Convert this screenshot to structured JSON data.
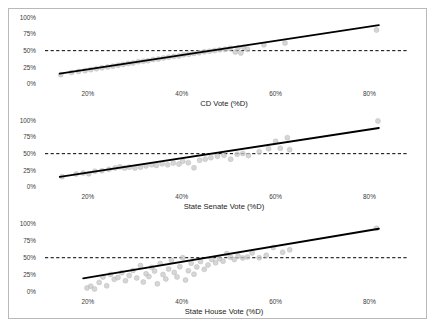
{
  "figure": {
    "background_color": "#ffffff",
    "border_color": "#b9b9b9",
    "panel_count": 3
  },
  "style": {
    "point_color": "#c8c8c8",
    "point_edge_color": "#b0b0b0",
    "line_color": "#000000",
    "reference_line_color": "#000000",
    "axis_color": "#8a8a8a",
    "tick_text_color": "#3a3a3a",
    "title_text_color": "#1a1a1a"
  },
  "chart_data": [
    {
      "type": "scatter",
      "title": "",
      "xlabel": "CD Vote (%D)",
      "ylabel": "",
      "xlim": [
        10,
        88
      ],
      "ylim": [
        0,
        105
      ],
      "xticks": [
        20,
        40,
        60,
        80
      ],
      "xticklabels": [
        "20%",
        "40%",
        "60%",
        "80%"
      ],
      "yticks": [
        0,
        25,
        50,
        75,
        100
      ],
      "yticklabels": [
        "0%",
        "25%",
        "50%",
        "75%",
        "100%"
      ],
      "grid": false,
      "legend": "none",
      "reference_line": {
        "orientation": "horizontal",
        "y": 50,
        "style": "dashed"
      },
      "fit_line": {
        "slope": 1.07,
        "intercept": 0.5,
        "x_start": 14,
        "x_end": 82,
        "style": "solid"
      },
      "points": [
        [
          14.2,
          14.0
        ],
        [
          16.5,
          17.2
        ],
        [
          18.0,
          18.8
        ],
        [
          19.4,
          20.0
        ],
        [
          20.6,
          21.5
        ],
        [
          21.8,
          23.0
        ],
        [
          23.0,
          24.2
        ],
        [
          24.2,
          25.6
        ],
        [
          25.3,
          26.8
        ],
        [
          26.4,
          28.2
        ],
        [
          27.5,
          29.4
        ],
        [
          28.6,
          30.8
        ],
        [
          29.6,
          31.6
        ],
        [
          30.7,
          33.4
        ],
        [
          31.8,
          34.2
        ],
        [
          32.8,
          35.0
        ],
        [
          33.9,
          36.8
        ],
        [
          35.0,
          37.4
        ],
        [
          36.1,
          38.9
        ],
        [
          37.2,
          40.2
        ],
        [
          38.3,
          41.5
        ],
        [
          39.4,
          42.0
        ],
        [
          40.4,
          43.8
        ],
        [
          41.5,
          44.6
        ],
        [
          42.6,
          45.9
        ],
        [
          43.7,
          46.8
        ],
        [
          44.8,
          48.2
        ],
        [
          45.9,
          49.0
        ],
        [
          47.0,
          50.2
        ],
        [
          48.1,
          51.4
        ],
        [
          49.2,
          52.2
        ],
        [
          50.3,
          53.6
        ],
        [
          51.4,
          48.0
        ],
        [
          52.0,
          54.5
        ],
        [
          52.6,
          46.5
        ],
        [
          53.2,
          55.2
        ],
        [
          54.0,
          52.0
        ],
        [
          57.5,
          58.8
        ],
        [
          62.0,
          61.5
        ],
        [
          81.5,
          81.0
        ]
      ]
    },
    {
      "type": "scatter",
      "title": "",
      "xlabel": "State Senate Vote (%D)",
      "ylabel": "",
      "xlim": [
        10,
        88
      ],
      "ylim": [
        0,
        105
      ],
      "xticks": [
        20,
        40,
        60,
        80
      ],
      "xticklabels": [
        "20%",
        "40%",
        "60%",
        "80%"
      ],
      "yticks": [
        0,
        25,
        50,
        75,
        100
      ],
      "yticklabels": [
        "0%",
        "25%",
        "50%",
        "75%",
        "100%"
      ],
      "grid": false,
      "legend": "none",
      "reference_line": {
        "orientation": "horizontal",
        "y": 50,
        "style": "dashed"
      },
      "fit_line": {
        "slope": 1.08,
        "intercept": 0.0,
        "x_start": 14,
        "x_end": 82,
        "style": "solid"
      },
      "points": [
        [
          14.5,
          15.5
        ],
        [
          17.5,
          19.5
        ],
        [
          19.0,
          21.0
        ],
        [
          20.2,
          19.8
        ],
        [
          21.5,
          23.6
        ],
        [
          23.0,
          24.4
        ],
        [
          24.5,
          26.5
        ],
        [
          25.8,
          28.6
        ],
        [
          26.8,
          30.2
        ],
        [
          27.8,
          28.5
        ],
        [
          28.8,
          29.8
        ],
        [
          30.0,
          28.4
        ],
        [
          31.2,
          29.8
        ],
        [
          32.4,
          31.6
        ],
        [
          33.6,
          33.4
        ],
        [
          34.6,
          32.4
        ],
        [
          35.8,
          34.8
        ],
        [
          37.0,
          33.2
        ],
        [
          38.2,
          36.0
        ],
        [
          39.4,
          34.4
        ],
        [
          40.2,
          38.6
        ],
        [
          41.4,
          36.4
        ],
        [
          42.6,
          28.8
        ],
        [
          43.8,
          40.0
        ],
        [
          45.0,
          41.8
        ],
        [
          46.2,
          44.0
        ],
        [
          47.6,
          46.0
        ],
        [
          49.0,
          47.6
        ],
        [
          50.4,
          41.8
        ],
        [
          51.8,
          49.2
        ],
        [
          53.0,
          50.4
        ],
        [
          54.2,
          47.2
        ],
        [
          56.5,
          53.0
        ],
        [
          58.5,
          57.5
        ],
        [
          60.0,
          68.5
        ],
        [
          61.0,
          58.0
        ],
        [
          62.5,
          74.0
        ],
        [
          63.0,
          56.0
        ],
        [
          81.8,
          99.0
        ]
      ]
    },
    {
      "type": "scatter",
      "title": "",
      "xlabel": "State House Vote (%D)",
      "ylabel": "",
      "xlim": [
        10,
        88
      ],
      "ylim": [
        0,
        105
      ],
      "xticks": [
        20,
        40,
        60,
        80
      ],
      "xticklabels": [
        "20%",
        "40%",
        "60%",
        "80%"
      ],
      "yticks": [
        0,
        25,
        50,
        75,
        100
      ],
      "yticklabels": [
        "0%",
        "25%",
        "50%",
        "75%",
        "100%"
      ],
      "grid": false,
      "legend": "none",
      "reference_line": {
        "orientation": "horizontal",
        "y": 50,
        "style": "dashed"
      },
      "fit_line": {
        "slope": 1.15,
        "intercept": -2.0,
        "x_start": 19,
        "x_end": 82,
        "style": "solid"
      },
      "points": [
        [
          19.8,
          6.0
        ],
        [
          20.6,
          8.5
        ],
        [
          21.4,
          4.5
        ],
        [
          22.4,
          14.0
        ],
        [
          23.2,
          22.0
        ],
        [
          24.0,
          9.0
        ],
        [
          24.8,
          25.5
        ],
        [
          25.6,
          18.5
        ],
        [
          26.4,
          21.0
        ],
        [
          27.2,
          28.0
        ],
        [
          28.0,
          16.5
        ],
        [
          28.8,
          24.0
        ],
        [
          29.6,
          31.5
        ],
        [
          30.4,
          20.5
        ],
        [
          31.2,
          38.5
        ],
        [
          31.8,
          14.5
        ],
        [
          32.4,
          26.5
        ],
        [
          33.0,
          22.5
        ],
        [
          33.6,
          36.0
        ],
        [
          34.2,
          30.5
        ],
        [
          34.8,
          12.0
        ],
        [
          35.4,
          41.5
        ],
        [
          36.0,
          25.5
        ],
        [
          36.6,
          19.0
        ],
        [
          37.2,
          33.5
        ],
        [
          37.8,
          46.0
        ],
        [
          38.4,
          28.5
        ],
        [
          39.0,
          22.0
        ],
        [
          39.6,
          37.0
        ],
        [
          40.2,
          50.0
        ],
        [
          40.8,
          17.5
        ],
        [
          41.4,
          31.0
        ],
        [
          42.0,
          42.0
        ],
        [
          42.6,
          26.0
        ],
        [
          43.2,
          36.5
        ],
        [
          44.0,
          44.5
        ],
        [
          44.8,
          33.0
        ],
        [
          45.6,
          39.5
        ],
        [
          46.4,
          47.5
        ],
        [
          47.2,
          42.5
        ],
        [
          48.0,
          48.5
        ],
        [
          48.8,
          45.0
        ],
        [
          49.6,
          56.0
        ],
        [
          50.4,
          50.5
        ],
        [
          51.2,
          47.5
        ],
        [
          52.0,
          52.5
        ],
        [
          53.0,
          49.5
        ],
        [
          54.0,
          51.0
        ],
        [
          55.0,
          57.0
        ],
        [
          56.5,
          50.0
        ],
        [
          58.0,
          53.5
        ],
        [
          59.5,
          65.0
        ],
        [
          61.5,
          58.0
        ],
        [
          63.0,
          61.5
        ],
        [
          81.5,
          93.0
        ]
      ]
    }
  ]
}
